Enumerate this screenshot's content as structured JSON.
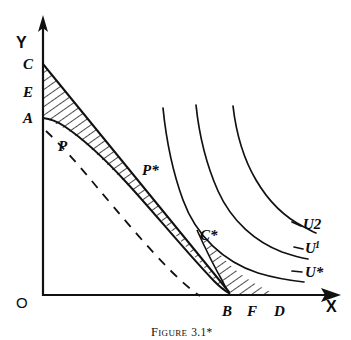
{
  "figure": {
    "caption_prefix": "Figure",
    "caption_number": "3.1*",
    "caption_full": "FIGURE 3.1*"
  },
  "axes": {
    "x_label": "X",
    "y_label": "Y",
    "origin_label": "O",
    "x_axis_y": 295,
    "y_axis_x": 43,
    "x_axis_start": 43,
    "x_axis_end": 340,
    "y_axis_top": 18
  },
  "points": [
    {
      "id": "C",
      "label": "C",
      "x": 23,
      "y": 64,
      "on_axis": "y"
    },
    {
      "id": "E",
      "label": "E",
      "x": 23,
      "y": 92,
      "on_axis": "y"
    },
    {
      "id": "A",
      "label": "A",
      "x": 23,
      "y": 118,
      "on_axis": "y"
    },
    {
      "id": "P",
      "label": "P",
      "x": 60,
      "y": 146,
      "on_axis": "none"
    },
    {
      "id": "Pstar",
      "label": "P*",
      "x": 143,
      "y": 170,
      "on_axis": "none"
    },
    {
      "id": "Cstar",
      "label": "C*",
      "x": 201,
      "y": 235,
      "on_axis": "none"
    },
    {
      "id": "B",
      "label": "B",
      "x": 223,
      "y": 312,
      "on_axis": "x"
    },
    {
      "id": "F",
      "label": "F",
      "x": 248,
      "y": 312,
      "on_axis": "x"
    },
    {
      "id": "D",
      "label": "D",
      "x": 276,
      "y": 312,
      "on_axis": "x"
    }
  ],
  "curves": [
    {
      "id": "u-star",
      "label": "U*",
      "label_x": 305,
      "label_y": 272,
      "superscript": ""
    },
    {
      "id": "u-one",
      "label": "U",
      "label_x": 305,
      "label_y": 248,
      "superscript": "1"
    },
    {
      "id": "u-two",
      "label": "U2",
      "label_x": 303,
      "label_y": 224,
      "superscript": ""
    }
  ],
  "regions": [
    {
      "id": "upper-hatched-region",
      "name": "hatched-area-CAP",
      "vertices": "C-A-P-toward-B"
    },
    {
      "id": "lower-hatched-region",
      "name": "hatched-area-CstarBD",
      "vertices": "C*-B-D"
    }
  ],
  "colors": {
    "ink": "#111111",
    "paper": "#ffffff"
  }
}
